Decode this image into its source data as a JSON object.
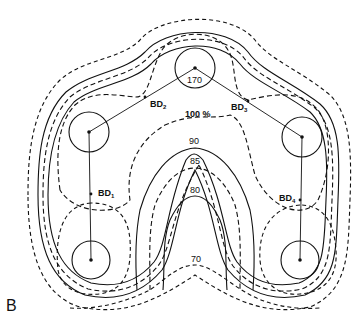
{
  "panel_label": "B",
  "contours": {
    "labels": {
      "c170": "170",
      "c100": "100 %",
      "c90": "90",
      "c85": "85",
      "c80": "80",
      "c70": "70"
    }
  },
  "boreholes": {
    "bd1": {
      "prefix": "BD",
      "sub": "1"
    },
    "bd2": {
      "prefix": "BD",
      "sub": "2"
    },
    "bd3": {
      "prefix": "BD",
      "sub": "3"
    },
    "bd4": {
      "prefix": "BD",
      "sub": "4"
    }
  },
  "colors": {
    "ink": "#111111",
    "background": "#ffffff"
  }
}
